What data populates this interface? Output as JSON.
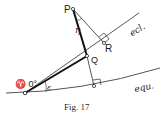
{
  "figure": {
    "caption": "Fig. 17",
    "colors": {
      "ink": "#1a1a1a",
      "background": "#ffffff"
    },
    "points": {
      "P": {
        "label": "P",
        "x": 73,
        "y": 9
      },
      "R": {
        "label": "R",
        "x": 104,
        "y": 43
      },
      "Q": {
        "label": "Q",
        "x": 87,
        "y": 56
      },
      "F": {
        "label": "",
        "x": 94,
        "y": 86
      },
      "vernal": {
        "label": "♈ 0°",
        "x": 25,
        "y": 93
      }
    },
    "curves": {
      "ecliptic": {
        "label": "ecl."
      },
      "equator": {
        "label": "equ."
      }
    },
    "angles": {
      "eta": {
        "label": "η"
      },
      "epsilon": {
        "label": "ε"
      }
    }
  }
}
